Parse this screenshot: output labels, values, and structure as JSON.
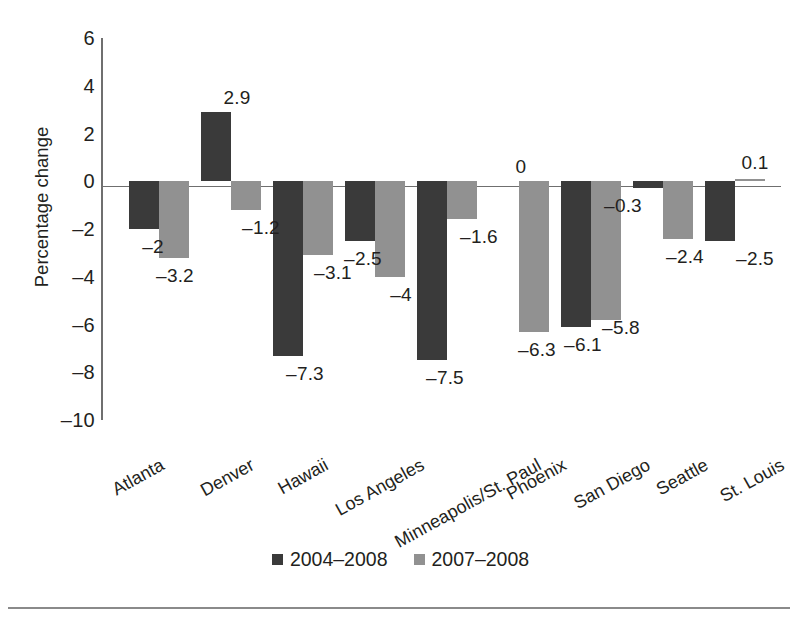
{
  "chart_data": {
    "type": "bar",
    "title": "",
    "subtitle": "",
    "xlabel": "",
    "ylabel": "Percentage change",
    "ylim": [
      -10,
      6
    ],
    "yticks": [
      6,
      4,
      2,
      0,
      -2,
      -4,
      -6,
      -8,
      -10
    ],
    "ytick_labels": [
      "6",
      "4",
      "2",
      "0",
      "–2",
      "–4",
      "–6",
      "–8",
      "–10"
    ],
    "grid": false,
    "legend_position": "bottom",
    "categories": [
      "Atlanta",
      "Denver",
      "Hawaii",
      "Los Angeles",
      "Minneapolis/St. Paul",
      "Phoenix",
      "San Diego",
      "Seattle",
      "St. Louis"
    ],
    "series": [
      {
        "name": "2004–2008",
        "color": "#3a3a3a",
        "values": [
          -2,
          2.9,
          -7.3,
          -2.5,
          -7.5,
          0,
          -6.1,
          -0.3,
          -2.5
        ],
        "labels": [
          "–2",
          "2.9",
          "–7.3",
          "–2.5",
          "–7.5",
          "0",
          "–6.1",
          "–0.3",
          "–2.5"
        ]
      },
      {
        "name": "2007–2008",
        "color": "#919191",
        "values": [
          -3.2,
          -1.2,
          -3.1,
          -4,
          -1.6,
          -6.3,
          -5.8,
          -2.4,
          0.1
        ],
        "labels": [
          "–3.2",
          "–1.2",
          "–3.1",
          "–4",
          "–1.6",
          "–6.3",
          "–5.8",
          "–2.4",
          "0.1"
        ]
      }
    ],
    "colors": {
      "series_dark": "#3a3a3a",
      "series_gray": "#919191",
      "axis": "#6f6f6f",
      "text": "#231f20",
      "background": "#ffffff"
    }
  },
  "legend": {
    "items": [
      {
        "label": "2004–2008",
        "color": "#3a3a3a"
      },
      {
        "label": "2007–2008",
        "color": "#919191"
      }
    ]
  }
}
